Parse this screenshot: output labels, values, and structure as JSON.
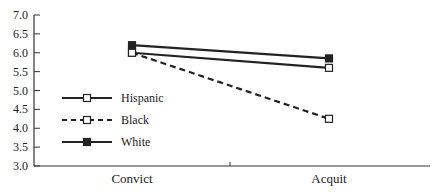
{
  "chart_data": {
    "type": "line",
    "title": "",
    "xlabel": "",
    "ylabel": "",
    "categories": [
      "Convict",
      "Acquit"
    ],
    "ylim": [
      3.0,
      7.0
    ],
    "yticks": [
      "3.0",
      "3.5",
      "4.0",
      "4.5",
      "5.0",
      "5.5",
      "6.0",
      "6.5",
      "7.0"
    ],
    "grid": false,
    "legend_position": "inside-left",
    "series": [
      {
        "name": "Hispanic",
        "values": [
          6.0,
          5.6
        ],
        "line": "solid",
        "marker": "open-square",
        "color": "#222222"
      },
      {
        "name": "Black",
        "values": [
          6.0,
          4.25
        ],
        "line": "dashed",
        "marker": "open-square",
        "color": "#222222"
      },
      {
        "name": "White",
        "values": [
          6.2,
          5.85
        ],
        "line": "solid",
        "marker": "filled-square",
        "color": "#222222"
      }
    ]
  }
}
